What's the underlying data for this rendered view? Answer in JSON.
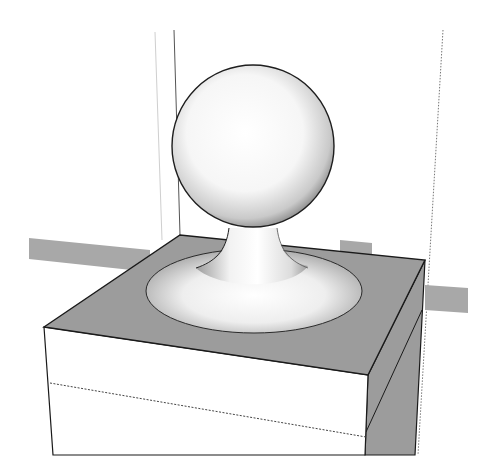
{
  "scene": {
    "description": "3D model: sphere finial on a flared neck atop a square post cap",
    "colors": {
      "background": "#ffffff",
      "face_grey": "#9a9a9a",
      "axis_bar": "#a8a8a8",
      "edge": "#1a1a1a",
      "sphere_light": "#ffffff",
      "sphere_shade": "#8c8c8c"
    }
  }
}
